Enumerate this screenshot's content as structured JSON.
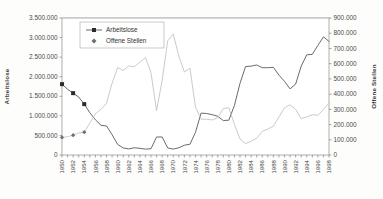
{
  "chart_data": {
    "type": "line",
    "title": "",
    "xlabel": "",
    "ylabel": "Arbeitslose",
    "y2label": "Offene Stellen",
    "grid": true,
    "legend_position": "top-left-inside",
    "ylim": [
      0,
      3500000
    ],
    "y2lim": [
      0,
      900000
    ],
    "ytick_labels": [
      "0",
      "500.000",
      "1.000.000",
      "1.500.000",
      "2.000.000",
      "2.500.000",
      "3.000.000",
      "3.500.000"
    ],
    "ytick_values": [
      0,
      500000,
      1000000,
      1500000,
      2000000,
      2500000,
      3000000,
      3500000
    ],
    "y2tick_labels": [
      "0",
      "100.000",
      "200.000",
      "300.000",
      "400.000",
      "500.000",
      "600.000",
      "700.000",
      "800.000",
      "900.000"
    ],
    "y2tick_values": [
      0,
      100000,
      200000,
      300000,
      400000,
      500000,
      600000,
      700000,
      800000,
      900000
    ],
    "x": [
      1950,
      1951,
      1952,
      1953,
      1954,
      1955,
      1956,
      1957,
      1958,
      1959,
      1960,
      1961,
      1962,
      1963,
      1964,
      1965,
      1966,
      1967,
      1968,
      1969,
      1970,
      1971,
      1972,
      1973,
      1974,
      1975,
      1976,
      1977,
      1978,
      1979,
      1980,
      1981,
      1982,
      1983,
      1984,
      1985,
      1986,
      1987,
      1988,
      1989,
      1990,
      1991,
      1992,
      1993,
      1994,
      1995,
      1996,
      1997,
      1998
    ],
    "xtick_labels": [
      "1950",
      "1952",
      "1954",
      "1956",
      "1958",
      "1960",
      "1962",
      "1964",
      "1966",
      "1968",
      "1970",
      "1972",
      "1974",
      "1976",
      "1978",
      "1980",
      "1982",
      "1984",
      "1986",
      "1988",
      "1990",
      "1992",
      "1994",
      "1996",
      "1998"
    ],
    "series": [
      {
        "name": "Arbeitslose",
        "axis": "left",
        "color": "#595959",
        "marker": "square",
        "values": [
          1810000,
          1680000,
          1580000,
          1480000,
          1300000,
          1080000,
          900000,
          760000,
          740000,
          520000,
          270000,
          180000,
          155000,
          185000,
          170000,
          150000,
          160000,
          460000,
          460000,
          180000,
          150000,
          185000,
          250000,
          275000,
          580000,
          1070000,
          1060000,
          1030000,
          990000,
          880000,
          890000,
          1270000,
          1830000,
          2260000,
          2270000,
          2300000,
          2230000,
          2230000,
          2240000,
          2040000,
          1880000,
          1690000,
          1810000,
          2270000,
          2560000,
          2570000,
          2800000,
          3020000,
          2900000
        ]
      },
      {
        "name": "Offene Stellen",
        "axis": "right",
        "color": "#c4c4c4",
        "marker": "diamond",
        "values": [
          115000,
          120000,
          130000,
          145000,
          150000,
          210000,
          270000,
          300000,
          340000,
          470000,
          575000,
          555000,
          585000,
          580000,
          610000,
          640000,
          540000,
          290000,
          490000,
          750000,
          795000,
          650000,
          545000,
          570000,
          315000,
          235000,
          235000,
          230000,
          245000,
          305000,
          310000,
          200000,
          105000,
          75000,
          90000,
          110000,
          155000,
          170000,
          190000,
          250000,
          310000,
          330000,
          300000,
          240000,
          250000,
          265000,
          260000,
          300000,
          340000
        ]
      }
    ],
    "legend": [
      {
        "label": "Arbeitslose",
        "marker": "square",
        "color": "#2b2b2b"
      },
      {
        "label": "Offene Stellen",
        "marker": "diamond",
        "color": "#6f6f6f"
      }
    ]
  }
}
